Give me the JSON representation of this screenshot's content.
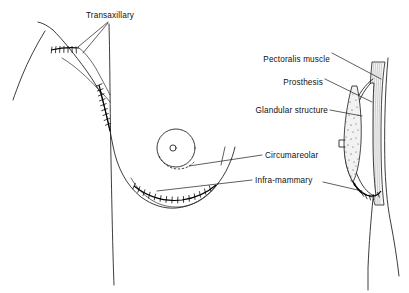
{
  "figure": {
    "background_color": "#ffffff",
    "line_color": "#1a1a1a",
    "width": 409,
    "height": 293
  },
  "labels": {
    "transaxillary": "Transaxillary",
    "circumareolar": "Circumareolar",
    "inframammary": "Infra-mammary",
    "pectoralis_muscle": "Pectoralis muscle",
    "prosthesis": "Prosthesis",
    "glandular_structure": "Glandular structure"
  },
  "views": {
    "frontal": {
      "name": "frontal-torso-view",
      "features": [
        "arm-outline",
        "torso-midline",
        "breast-contour",
        "areola-circle",
        "nipple-circle",
        "axillary-suture",
        "lateral-suture",
        "circumareolar-incision",
        "inframammary-suture"
      ]
    },
    "lateral": {
      "name": "lateral-cross-section-view",
      "features": [
        "chest-wall",
        "pectoralis-muscle-band",
        "prosthesis-outline",
        "glandular-tissue",
        "nipple-profile",
        "inframammary-suture-profile"
      ]
    }
  }
}
